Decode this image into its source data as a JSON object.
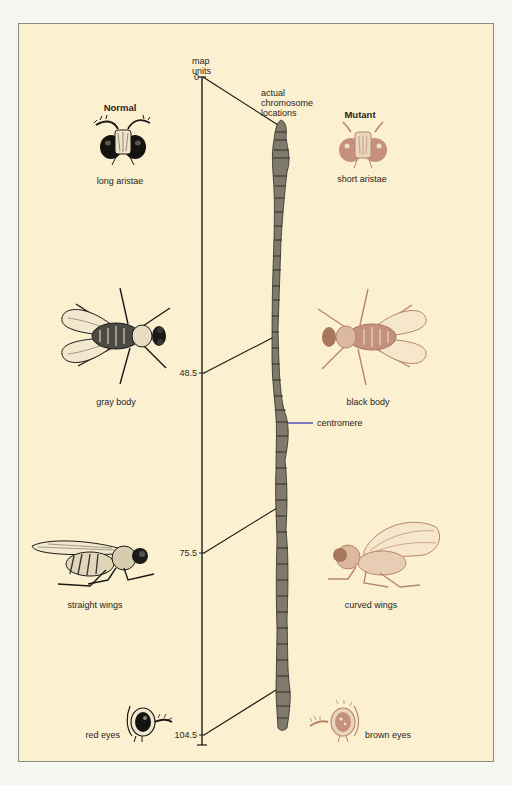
{
  "figure": {
    "columns": {
      "normal": "Normal",
      "mutant": "Mutant"
    },
    "axis": {
      "title_line1": "map",
      "title_line2": "units",
      "chromosome_label_line1": "actual",
      "chromosome_label_line2": "chromosome",
      "chromosome_label_line3": "locations"
    },
    "map_positions": [
      {
        "value": "0",
        "normal": "long aristae",
        "mutant": "short aristae"
      },
      {
        "value": "48.5",
        "normal": "gray body",
        "mutant": "black body"
      },
      {
        "value": "75.5",
        "normal": "straight wings",
        "mutant": "curved wings"
      },
      {
        "value": "104.5",
        "normal": "red eyes",
        "mutant": "brown eyes"
      }
    ],
    "centromere_label": "centromere",
    "colors": {
      "background": "#fbf0d0",
      "normal_ink": "#1c1a18",
      "mutant_ink": "#b8866a",
      "centromere_line": "#4a43b0"
    }
  }
}
